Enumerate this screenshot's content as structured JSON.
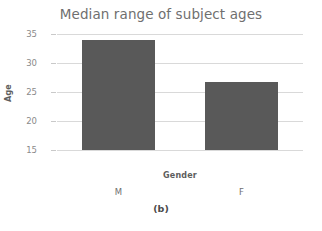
{
  "chart_data": {
    "type": "bar",
    "title": "Median range of subject ages",
    "xlabel": "Gender",
    "ylabel": "Age",
    "categories": [
      "M",
      "F"
    ],
    "values": [
      34,
      26.8
    ],
    "ylim": [
      15,
      35
    ],
    "yticks": [
      35,
      30,
      25,
      20,
      15
    ],
    "ytick_labels": [
      "35",
      "30",
      "25",
      "20",
      "15"
    ],
    "grid": true,
    "legend": "none",
    "bar_color": "#595959",
    "grid_color": "#d9d9d9",
    "title_color": "#6f6f6f",
    "tick_label_color": "#8a8a8a",
    "axis_title_color": "#5d5d5d",
    "background": "#ffffff"
  },
  "caption": {
    "text": "(b)"
  }
}
